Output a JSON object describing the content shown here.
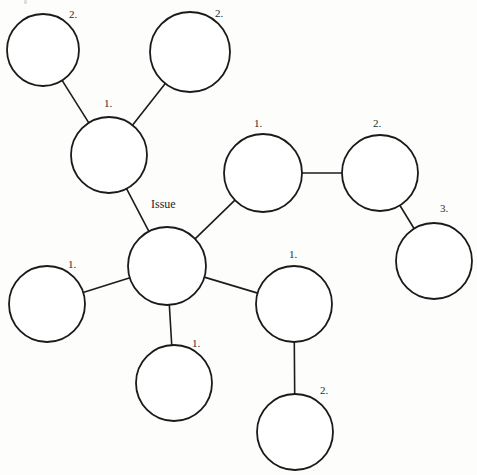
{
  "diagram": {
    "type": "mind-map",
    "title": "Issue",
    "canvas": {
      "width": 477,
      "height": 475,
      "background": "#fdfdfc"
    },
    "style": {
      "node_fill": "#ffffff",
      "node_stroke": "#1a1a1a",
      "edge_stroke": "#1c1c1c",
      "label_color": "#2b2b2b"
    },
    "nodes": [
      {
        "id": "center",
        "label": "Issue",
        "cx": 167,
        "cy": 266,
        "r": 39,
        "label_x": 151,
        "label_y": 205,
        "label_anchor": "start",
        "role": "root"
      },
      {
        "id": "ul-hub",
        "label": "1.",
        "cx": 109,
        "cy": 155,
        "r": 38,
        "label_x": 104,
        "label_y": 104,
        "label_anchor": "start",
        "role": "branch"
      },
      {
        "id": "ul-leaf-a",
        "label": "2.",
        "cx": 43,
        "cy": 50,
        "r": 36,
        "label_x": 69,
        "label_y": 15,
        "label_anchor": "start",
        "role": "leaf"
      },
      {
        "id": "ul-leaf-b",
        "label": "2.",
        "cx": 190,
        "cy": 52,
        "r": 40,
        "label_x": 215,
        "label_y": 14,
        "label_anchor": "start",
        "role": "leaf"
      },
      {
        "id": "right-1",
        "label": "1.",
        "cx": 263,
        "cy": 173,
        "r": 39,
        "label_x": 254,
        "label_y": 124,
        "label_anchor": "start",
        "role": "branch"
      },
      {
        "id": "right-2",
        "label": "2.",
        "cx": 380,
        "cy": 173,
        "r": 38,
        "label_x": 373,
        "label_y": 124,
        "label_anchor": "start",
        "role": "branch"
      },
      {
        "id": "right-3",
        "label": "3.",
        "cx": 434,
        "cy": 261,
        "r": 38,
        "label_x": 440,
        "label_y": 209,
        "label_anchor": "start",
        "role": "leaf"
      },
      {
        "id": "br-1",
        "label": "1.",
        "cx": 294,
        "cy": 304,
        "r": 38,
        "label_x": 289,
        "label_y": 255,
        "label_anchor": "start",
        "role": "branch"
      },
      {
        "id": "br-2",
        "label": "2.",
        "cx": 295,
        "cy": 432,
        "r": 38,
        "label_x": 320,
        "label_y": 391,
        "label_anchor": "start",
        "role": "leaf"
      },
      {
        "id": "left-1",
        "label": "1.",
        "cx": 47,
        "cy": 304,
        "r": 38,
        "label_x": 68,
        "label_y": 265,
        "label_anchor": "start",
        "role": "leaf"
      },
      {
        "id": "bottom-1",
        "label": "1.",
        "cx": 174,
        "cy": 383,
        "r": 38,
        "label_x": 192,
        "label_y": 344,
        "label_anchor": "start",
        "role": "leaf"
      }
    ],
    "edges": [
      {
        "from": "center",
        "to": "ul-hub"
      },
      {
        "from": "center",
        "to": "right-1"
      },
      {
        "from": "center",
        "to": "br-1"
      },
      {
        "from": "center",
        "to": "left-1"
      },
      {
        "from": "center",
        "to": "bottom-1"
      },
      {
        "from": "ul-hub",
        "to": "ul-leaf-a"
      },
      {
        "from": "ul-hub",
        "to": "ul-leaf-b"
      },
      {
        "from": "right-1",
        "to": "right-2"
      },
      {
        "from": "right-2",
        "to": "right-3"
      },
      {
        "from": "br-1",
        "to": "br-2"
      }
    ]
  }
}
